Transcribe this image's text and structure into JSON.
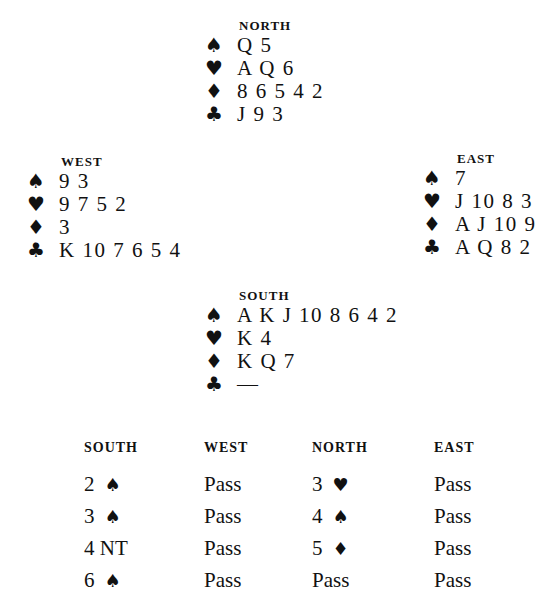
{
  "hands": {
    "north": {
      "label": "NORTH",
      "spades": "Q 5",
      "hearts": "A Q 6",
      "diamonds": "8 6 5 4 2",
      "clubs": "J 9 3"
    },
    "west": {
      "label": "WEST",
      "spades": "9 3",
      "hearts": "9 7 5 2",
      "diamonds": "3",
      "clubs": "K 10 7 6 5 4"
    },
    "east": {
      "label": "EAST",
      "spades": "7",
      "hearts": "J 10 8 3",
      "diamonds": "A J 10 9",
      "clubs": "A Q 8 2"
    },
    "south": {
      "label": "SOUTH",
      "spades": "A K J 10 8 6 4 2",
      "hearts": "K 4",
      "diamonds": "K Q 7",
      "clubs": "—"
    }
  },
  "suits": {
    "spades": "♠",
    "hearts": "♥",
    "diamonds": "♦",
    "clubs": "♣"
  },
  "auction": {
    "headers": [
      "SOUTH",
      "WEST",
      "NORTH",
      "EAST"
    ],
    "rows": [
      [
        {
          "level": "2",
          "suit": "♠"
        },
        {
          "level": "Pass",
          "suit": ""
        },
        {
          "level": "3",
          "suit": "♥"
        },
        {
          "level": "Pass",
          "suit": ""
        }
      ],
      [
        {
          "level": "3",
          "suit": "♠"
        },
        {
          "level": "Pass",
          "suit": ""
        },
        {
          "level": "4",
          "suit": "♠"
        },
        {
          "level": "Pass",
          "suit": ""
        }
      ],
      [
        {
          "level": "4 NT",
          "suit": ""
        },
        {
          "level": "Pass",
          "suit": ""
        },
        {
          "level": "5",
          "suit": "♦"
        },
        {
          "level": "Pass",
          "suit": ""
        }
      ],
      [
        {
          "level": "6",
          "suit": "♠"
        },
        {
          "level": "Pass",
          "suit": ""
        },
        {
          "level": "Pass",
          "suit": ""
        },
        {
          "level": "Pass",
          "suit": ""
        }
      ]
    ]
  }
}
